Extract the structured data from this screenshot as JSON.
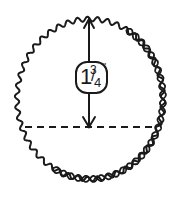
{
  "diagram": {
    "type": "measurement-illustration",
    "shape": "scalloped-circle",
    "border_detail": "twisted rope edge along lower-right",
    "measurement": {
      "whole": "1",
      "numerator": "3",
      "denominator": "4",
      "unit": "\"",
      "text": "1 3/4\""
    },
    "arrow": "vertical double-ended arrow from top edge to dashed line",
    "reference_line": "dashed horizontal line",
    "colors": {
      "stroke": "#1a1a1a",
      "background": "#ffffff"
    }
  }
}
